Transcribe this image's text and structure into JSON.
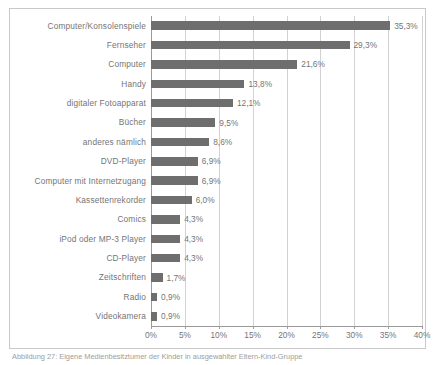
{
  "chart_data": {
    "type": "bar",
    "orientation": "horizontal",
    "title": "",
    "xlabel": "",
    "ylabel": "",
    "xlim": [
      0,
      40
    ],
    "xticks": [
      "0%",
      "5%",
      "10%",
      "15%",
      "20%",
      "25%",
      "30%",
      "35%",
      "40%"
    ],
    "xtick_values": [
      0,
      5,
      10,
      15,
      20,
      25,
      30,
      35,
      40
    ],
    "grid": "vertical",
    "legend": null,
    "bar_color": "#6e6e6e",
    "categories": [
      "Computer/Konsolenspiele",
      "Fernseher",
      "Computer",
      "Handy",
      "digitaler Fotoapparat",
      "Bücher",
      "anderes nämlich",
      "DVD-Player",
      "Computer mit Internetzugang",
      "Kassettenrekorder",
      "Comics",
      "iPod oder MP-3 Player",
      "CD-Player",
      "Zeitschriften",
      "Radio",
      "Videokamera"
    ],
    "values": [
      35.3,
      29.3,
      21.6,
      13.8,
      12.1,
      9.5,
      8.6,
      6.9,
      6.9,
      6.0,
      4.3,
      4.3,
      4.3,
      1.7,
      0.9,
      0.9
    ],
    "data_labels": [
      "35,3%",
      "29,3%",
      "21,6%",
      "13,8%",
      "12,1%",
      "9,5%",
      "8,6%",
      "6,9%",
      "6,9%",
      "6,0%",
      "4,3%",
      "4,3%",
      "4,3%",
      "1,7%",
      "0,9%",
      "0,9%"
    ]
  },
  "caption": "Abbildung 27: Eigene Medienbesitztumer der Kinder in ausgewahlter Eltern-Kind-Gruppe"
}
